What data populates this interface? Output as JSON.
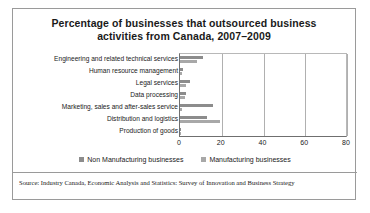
{
  "figure": {
    "title": "Percentage of businesses that outsourced business activities from Canada, 2007–2009",
    "title_line1": "Percentage of businesses that outsourced business",
    "title_line2": "activities from Canada, 2007–2009",
    "source": "Source: Industry Canada, Economic Analysis and Statistics: Survey of Innovation and Business Strategy"
  },
  "legend": {
    "items": [
      {
        "label": "Non Manufacturing businesses",
        "color": "#8c8c8c"
      },
      {
        "label": "Manufacturing businesses",
        "color": "#a8a8a8"
      }
    ]
  },
  "chart_data": {
    "type": "bar",
    "orientation": "horizontal",
    "title": "Percentage of businesses that outsourced business activities from Canada, 2007–2009",
    "xlabel": "",
    "ylabel": "",
    "xlim": [
      0,
      80
    ],
    "xticks": [
      0,
      20,
      40,
      60,
      80
    ],
    "xtick_labels": [
      "0",
      "20",
      "40",
      "60",
      "80"
    ],
    "grid": true,
    "legend_position": "bottom",
    "categories": [
      "Engineering and related technical services",
      "Human resource management",
      "Legal services",
      "Data processing",
      "Marketing, sales and after-sales service",
      "Distribution and logistics",
      "Production of goods"
    ],
    "series": [
      {
        "name": "Non Manufacturing businesses",
        "color": "#8c8c8c",
        "values": [
          11,
          1.5,
          5,
          3,
          16,
          13,
          0.4
        ]
      },
      {
        "name": "Manufacturing businesses",
        "color": "#a8a8a8",
        "values": [
          8,
          1,
          3,
          2.5,
          1,
          19,
          0.3
        ]
      }
    ]
  }
}
